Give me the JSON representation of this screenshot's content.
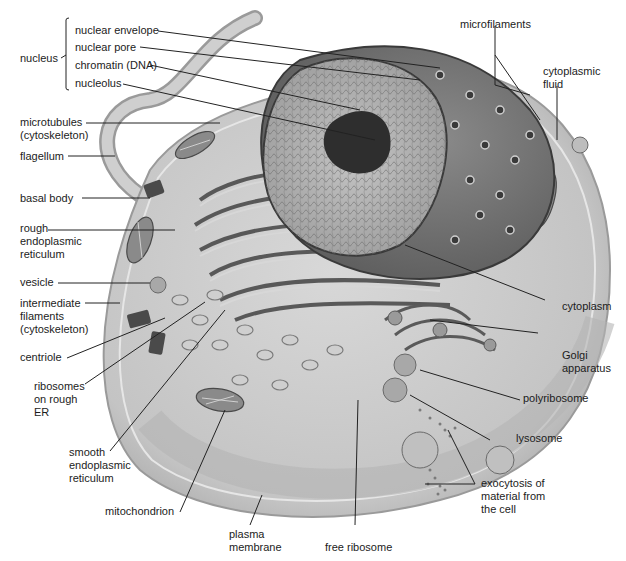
{
  "diagram": {
    "colors": {
      "background": "#ffffff",
      "cell_body": "#c9c9c9",
      "membrane": "#b0b0b0",
      "nucleus_outer": "#6e6e6e",
      "nucleoplasm": "#b5b5b5",
      "nucleolus": "#2e2e2e",
      "leader_line": "#222222"
    },
    "labels": {
      "nucleus": "nucleus",
      "nuclear_envelope": "nuclear envelope",
      "nuclear_pore": "nuclear pore",
      "chromatin": "chromatin (DNA)",
      "nucleolus": "nucleolus",
      "microtubules_1": "microtubules",
      "microtubules_2": "(cytoskeleton)",
      "flagellum": "flagellum",
      "basal_body": "basal body",
      "rough_er_1": "rough",
      "rough_er_2": "endoplasmic",
      "rough_er_3": "reticulum",
      "vesicle": "vesicle",
      "intermediate_1": "intermediate",
      "intermediate_2": "filaments",
      "intermediate_3": "(cytoskeleton)",
      "centriole": "centriole",
      "ribosomes_1": "ribosomes",
      "ribosomes_2": "on rough",
      "ribosomes_3": "ER",
      "smooth_er_1": "smooth",
      "smooth_er_2": "endoplasmic",
      "smooth_er_3": "reticulum",
      "mitochondrion": "mitochondrion",
      "plasma_membrane_1": "plasma",
      "plasma_membrane_2": "membrane",
      "free_ribosome": "free ribosome",
      "microfilaments": "microfilaments",
      "cytoplasmic_fluid_1": "cytoplasmic",
      "cytoplasmic_fluid_2": "fluid",
      "cytoplasm": "cytoplasm",
      "golgi_1": "Golgi",
      "golgi_2": "apparatus",
      "polyribosome": "polyribosome",
      "lysosome": "lysosome",
      "exocytosis_1": "exocytosis of",
      "exocytosis_2": "material from",
      "exocytosis_3": "the cell"
    }
  }
}
